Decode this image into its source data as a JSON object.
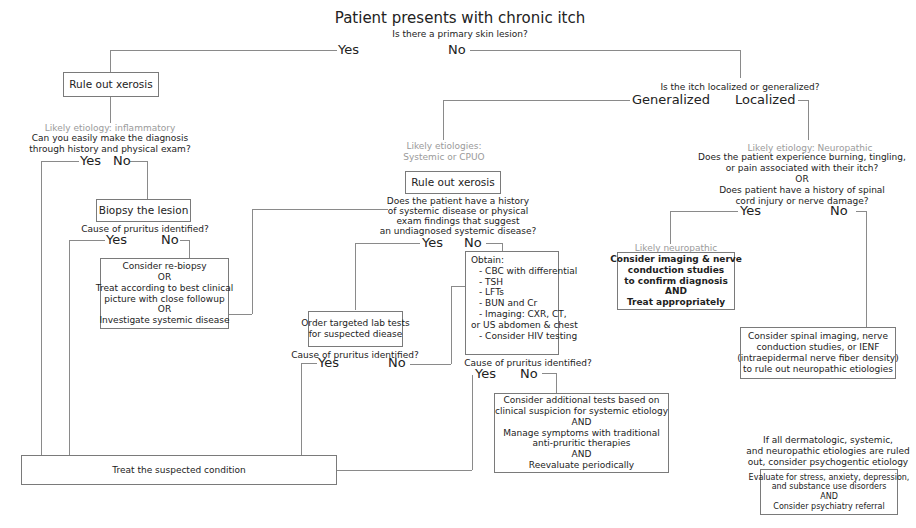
{
  "root": {
    "title": "Patient presents with chronic itch",
    "question": "Is there a primary skin lesion?",
    "yes": "Yes",
    "no": "No"
  },
  "lesion_branch": {
    "rule_out": "Rule out xerosis",
    "etiology": "Likely etiology: inflammatory",
    "question": [
      "Can you easily make the diagnosis",
      "through history and physical exam?"
    ],
    "yes": "Yes",
    "no": "No",
    "biopsy": "Biopsy the lesion",
    "biopsy_question": "Cause of pruritus identified?",
    "biopsy_yes": "Yes",
    "biopsy_no": "No",
    "rebiopsy_box": [
      "Consider re-biopsy",
      "OR",
      "Treat according to best clinical",
      "picture with close followup",
      "OR",
      "Investigate systemic disease"
    ]
  },
  "no_lesion_branch": {
    "question": "Is the itch localized or generalized?",
    "generalized": "Generalized",
    "localized": "Localized"
  },
  "generalized_branch": {
    "etiology": [
      "Likely etiologies:",
      "Systemic or CPUO"
    ],
    "rule_out": "Rule out xerosis",
    "question": [
      "Does the patient have a history",
      "of systemic disease or physical",
      "exam findings that suggest",
      "an undiagnosed systemic disease?"
    ],
    "yes": "Yes",
    "no": "No",
    "targeted_box": [
      "Order targeted lab tests",
      "for suspected diease"
    ],
    "targeted_question": "Cause of pruritus identified?",
    "targeted_yes": "Yes",
    "targeted_no": "No",
    "obtain_box": {
      "heading": "Obtain:",
      "items": [
        "- CBC with differential",
        "- TSH",
        "- LFTs",
        "- BUN and Cr",
        "- Imaging: CXR, CT,",
        "or US abdomen & chest",
        "- Consider HIV testing"
      ]
    },
    "obtain_question": "Cause of pruritus identified?",
    "obtain_yes": "Yes",
    "obtain_no": "No",
    "additional_box": [
      "Consider additional tests based on",
      "clinical suspicion for systemic etiology",
      "AND",
      "Manage symptoms with traditional",
      "anti-pruritic therapies",
      "AND",
      "Reevaluate periodically"
    ]
  },
  "localized_branch": {
    "etiology": "Likely etiology: Neuropathic",
    "question": [
      "Does the patient experience burning, tingling,",
      "or pain associated with their itch?",
      "OR",
      "Does patient have a history of spinal",
      "cord injury or nerve damage?"
    ],
    "yes": "Yes",
    "no": "No",
    "neuro_label": "Likely neuropathic",
    "neuro_box": [
      "Consider imaging & nerve",
      "conduction studies",
      "to confirm diagnosis",
      "AND",
      "Treat appropriately"
    ],
    "spinal_box": [
      "Consider spinal imaging, nerve",
      "conduction studies, or IENF",
      "(intraepidermal nerve fiber density)",
      "to rule out neuropathic etiologies"
    ]
  },
  "treat_box": "Treat the suspected condition",
  "psychogenic": {
    "note": [
      "If all dermatologic, systemic,",
      "and neuropathic etiologies are ruled",
      "out, consider psychogentic etiology"
    ],
    "box": [
      "Evaluate for stress, anxiety, depression,",
      "and substance use disorders",
      "AND",
      "Consider psychiatry referral"
    ]
  }
}
